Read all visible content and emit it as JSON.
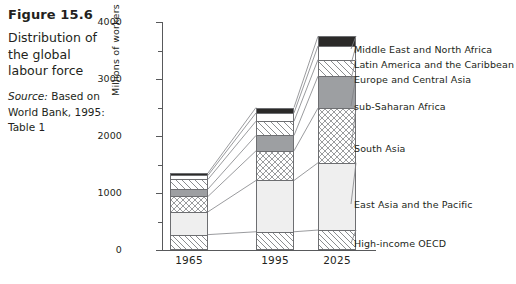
{
  "caption": {
    "figure_number": "Figure 15.6",
    "description": "Distribution of the global labour force",
    "source_prefix": "Source:",
    "source_text": " Based on World Bank, 1995: Table 1"
  },
  "chart_data": {
    "type": "bar",
    "stacked": true,
    "title": "Distribution of the global labour force",
    "xlabel": "",
    "ylabel": "Millions of workers",
    "categories": [
      "1965",
      "1995",
      "2025"
    ],
    "ylim": [
      0,
      4000
    ],
    "yticks": [
      0,
      1000,
      2000,
      3000,
      4000
    ],
    "yminorticks": [
      500,
      1500,
      2500,
      3500
    ],
    "ytick_labels": [
      "0",
      "1000",
      "2000",
      "3000",
      "4000"
    ],
    "grid": false,
    "legend_position": "right",
    "series": [
      {
        "name": "High-income OECD",
        "pattern": "diagonal-hatch",
        "values": [
          270,
          320,
          350
        ]
      },
      {
        "name": "East Asia and the Pacific",
        "pattern": "light-solid",
        "values": [
          400,
          900,
          1180
        ]
      },
      {
        "name": "South Asia",
        "pattern": "cross-hatch",
        "values": [
          270,
          520,
          960
        ]
      },
      {
        "name": "sub-Saharan Africa",
        "pattern": "grey-solid",
        "values": [
          130,
          270,
          560
        ]
      },
      {
        "name": "Europe and Central Asia",
        "pattern": "wide-hatch",
        "values": [
          170,
          250,
          290
        ]
      },
      {
        "name": "Latin America and the Caribbean",
        "pattern": "white-solid",
        "values": [
          70,
          145,
          240
        ]
      },
      {
        "name": "Middle East and North Africa",
        "pattern": "black-solid",
        "values": [
          40,
          95,
          170
        ]
      }
    ],
    "totals": [
      1350,
      2500,
      3750
    ]
  },
  "legend": {
    "items": [
      "Middle East and North Africa",
      "Latin America and the Caribbean",
      "Europe and Central Asia",
      "sub-Saharan Africa",
      "South Asia",
      "East Asia and the Pacific",
      "High-income OECD"
    ]
  }
}
